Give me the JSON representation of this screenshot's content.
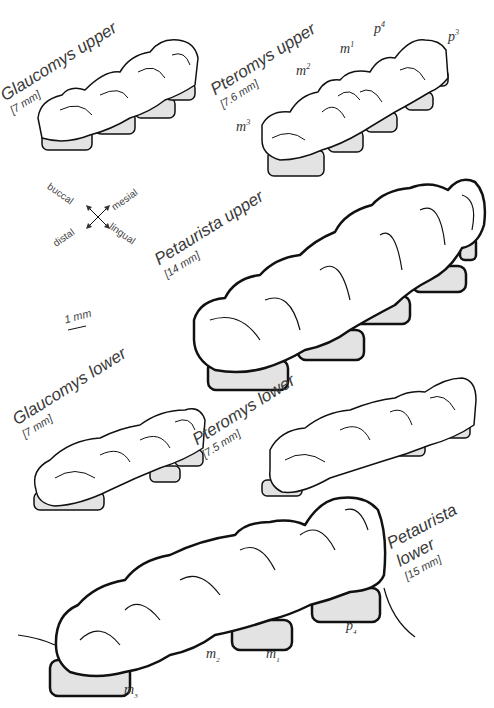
{
  "figure": {
    "panels": [
      {
        "id": "glaucomys-upper",
        "title": "Glaucomys upper",
        "size": "[7 mm]"
      },
      {
        "id": "pteromys-upper",
        "title": "Pteromys upper",
        "size": "[7.6 mm]",
        "tooth_labels": [
          {
            "base": "m",
            "sup": "3"
          },
          {
            "base": "m",
            "sup": "2"
          },
          {
            "base": "m",
            "sup": "1"
          },
          {
            "base": "p",
            "sup": "4"
          },
          {
            "base": "p",
            "sup": "3"
          }
        ]
      },
      {
        "id": "petaurista-upper",
        "title": "Petaurista upper",
        "size": "[14 mm]"
      },
      {
        "id": "glaucomys-lower",
        "title": "Glaucomys lower",
        "size": "[7 mm]"
      },
      {
        "id": "pteromys-lower",
        "title": "Pteromys lower",
        "size": "[7.5 mm]"
      },
      {
        "id": "petaurista-lower",
        "title_line1": "Petaurista",
        "title_line2": "lower",
        "size": "[15 mm]",
        "tooth_labels": [
          {
            "base": "m",
            "sub": "3"
          },
          {
            "base": "m",
            "sub": "2"
          },
          {
            "base": "m",
            "sub": "1"
          },
          {
            "base": "p",
            "sub": "4"
          }
        ]
      }
    ],
    "orientation": {
      "buccal": "buccal",
      "mesial": "mesial",
      "distal": "distal",
      "lingual": "lingual"
    },
    "scale_bar": "1 mm"
  }
}
